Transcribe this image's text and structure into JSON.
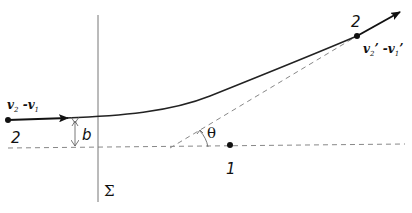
{
  "diagram": {
    "type": "scattering-trajectory",
    "colors": {
      "line": "#222222",
      "dashed": "#888888",
      "background": "#ffffff"
    },
    "labels": {
      "start_point": "2",
      "end_point": "2",
      "target_point": "1",
      "impact_parameter": "b",
      "angle": "θ",
      "plane": "Σ",
      "initial_velocity": {
        "base1": "v",
        "sub1": "2",
        "sep": " -",
        "base2": "v",
        "sub2": "1"
      },
      "final_velocity": {
        "base1": "v",
        "sub1": "2",
        "prime": "’",
        "sep": " -",
        "base2": "v",
        "sub2": "1",
        "prime2": "’"
      }
    }
  }
}
